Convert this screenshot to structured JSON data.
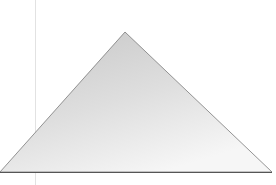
{
  "scene": {
    "shape": "triangle",
    "fill_light": "#f4f4f4",
    "fill_dark": "#c8c8c8",
    "edge_color": "#6e6e6e",
    "base_color": "#555555",
    "guide_line_color": "#e2e2e2",
    "background": "#ffffff"
  }
}
